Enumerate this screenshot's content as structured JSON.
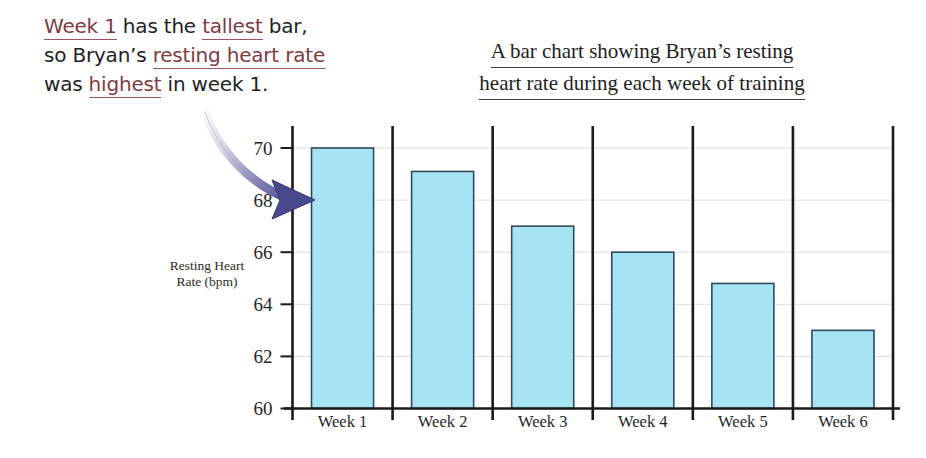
{
  "annotation": {
    "line1_a": "Week 1",
    "line1_b": " has the ",
    "line1_c": "tallest",
    "line1_d": " bar,",
    "line2_a": "so Bryan’s ",
    "line2_b": "resting heart rate",
    "line3_a": "was ",
    "line3_b": "highest",
    "line3_c": " in week 1.",
    "underline_color": "#9c555c"
  },
  "chart_data": {
    "type": "bar",
    "title_line1": "A bar chart showing Bryan’s resting",
    "title_line2": "heart rate during each week of training",
    "categories": [
      "Week 1",
      "Week 2",
      "Week 3",
      "Week 4",
      "Week 5",
      "Week 6"
    ],
    "values": [
      70,
      69.1,
      67,
      66,
      64.8,
      63
    ],
    "xlabel": "",
    "ylabel": "Resting Heart Rate (bpm)",
    "ylabel_line1": "Resting Heart",
    "ylabel_line2": "Rate (bpm)",
    "ylim": [
      60,
      70
    ],
    "ytick_labels": [
      "70",
      "68",
      "66",
      "64",
      "62",
      "60"
    ],
    "ytick_values": [
      70,
      68,
      66,
      64,
      62,
      60
    ],
    "grid": true,
    "legend": "none",
    "bar_fill": "#a6e4f4",
    "bar_stroke": "#2f4a5c",
    "axis_color": "#1a1a1a",
    "gridline_color": "#dedede",
    "annotation_arrow": {
      "name": "curved-arrow",
      "target_bar": "Week 1",
      "tail_color": "#f2f2f5",
      "head_color": "#49498d"
    }
  }
}
